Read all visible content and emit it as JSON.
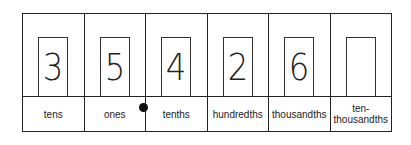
{
  "diagram": {
    "type": "place-value-chart",
    "decimal_point_after": "ones",
    "columns": [
      {
        "place": "tens",
        "digit": "3"
      },
      {
        "place": "ones",
        "digit": "5"
      },
      {
        "place": "tenths",
        "digit": "4"
      },
      {
        "place": "hundredths",
        "digit": "2"
      },
      {
        "place": "thousandths",
        "digit": "6"
      },
      {
        "place": "ten-\nthousandths",
        "digit": ""
      }
    ]
  }
}
